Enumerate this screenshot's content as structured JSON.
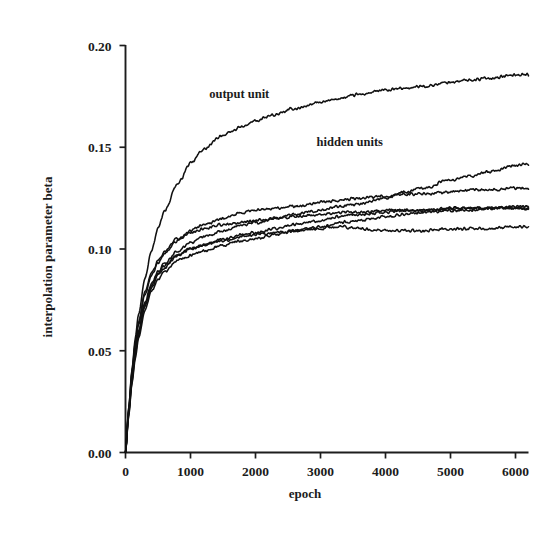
{
  "chart_data": {
    "type": "line",
    "title": "",
    "xlabel": "epoch",
    "ylabel": "interpolation parameter beta",
    "xlim": [
      0,
      6200
    ],
    "ylim": [
      0.0,
      0.2
    ],
    "grid": false,
    "legend": "none",
    "xticks": [
      0,
      1000,
      2000,
      3000,
      4000,
      5000,
      6000
    ],
    "xticklabels": [
      "0",
      "1000",
      "2000",
      "3000",
      "4000",
      "5000",
      "6000"
    ],
    "yticks": [
      0.0,
      0.05,
      0.1,
      0.15,
      0.2
    ],
    "yticklabels": [
      "0.00",
      "0.05",
      "0.10",
      "0.15",
      "0.20"
    ],
    "annotations": [
      {
        "text": "output unit",
        "x": 1750,
        "y": 0.174
      },
      {
        "text": "hidden units",
        "x": 3450,
        "y": 0.1505
      }
    ],
    "x": [
      0,
      50,
      100,
      150,
      200,
      300,
      400,
      500,
      600,
      800,
      1000,
      1200,
      1500,
      1800,
      2000,
      2300,
      2600,
      3000,
      3300,
      3600,
      4000,
      4300,
      4600,
      5000,
      5300,
      5600,
      6000,
      6150
    ],
    "series": [
      {
        "name": "output unit",
        "group": "output",
        "values": [
          0.0,
          0.022,
          0.041,
          0.056,
          0.068,
          0.086,
          0.099,
          0.11,
          0.119,
          0.132,
          0.142,
          0.149,
          0.156,
          0.16,
          0.163,
          0.166,
          0.169,
          0.172,
          0.174,
          0.176,
          0.178,
          0.179,
          0.18,
          0.182,
          0.183,
          0.184,
          0.1855,
          0.186
        ]
      },
      {
        "name": "hidden unit 1",
        "group": "hidden",
        "values": [
          0.0,
          0.02,
          0.037,
          0.05,
          0.06,
          0.074,
          0.083,
          0.089,
          0.093,
          0.099,
          0.103,
          0.106,
          0.109,
          0.112,
          0.113,
          0.115,
          0.117,
          0.119,
          0.121,
          0.122,
          0.125,
          0.128,
          0.13,
          0.134,
          0.136,
          0.138,
          0.141,
          0.142
        ]
      },
      {
        "name": "hidden unit 2",
        "group": "hidden",
        "values": [
          0.0,
          0.021,
          0.039,
          0.053,
          0.063,
          0.078,
          0.087,
          0.093,
          0.098,
          0.104,
          0.109,
          0.112,
          0.115,
          0.118,
          0.119,
          0.12,
          0.121,
          0.123,
          0.124,
          0.125,
          0.126,
          0.127,
          0.127,
          0.128,
          0.129,
          0.129,
          0.13,
          0.13
        ]
      },
      {
        "name": "hidden unit 3",
        "group": "hidden",
        "values": [
          0.0,
          0.019,
          0.035,
          0.048,
          0.058,
          0.072,
          0.081,
          0.087,
          0.091,
          0.097,
          0.1,
          0.102,
          0.105,
          0.107,
          0.108,
          0.11,
          0.112,
          0.114,
          0.116,
          0.117,
          0.118,
          0.119,
          0.119,
          0.12,
          0.12,
          0.12,
          0.121,
          0.121
        ]
      },
      {
        "name": "hidden unit 4",
        "group": "hidden",
        "values": [
          0.0,
          0.022,
          0.04,
          0.054,
          0.064,
          0.079,
          0.088,
          0.094,
          0.099,
          0.105,
          0.108,
          0.11,
          0.112,
          0.113,
          0.114,
          0.115,
          0.116,
          0.117,
          0.118,
          0.118,
          0.119,
          0.119,
          0.119,
          0.12,
          0.12,
          0.12,
          0.12,
          0.12
        ]
      },
      {
        "name": "hidden unit 5",
        "group": "hidden",
        "values": [
          0.0,
          0.018,
          0.034,
          0.046,
          0.056,
          0.07,
          0.079,
          0.085,
          0.089,
          0.094,
          0.097,
          0.099,
          0.102,
          0.104,
          0.105,
          0.107,
          0.109,
          0.111,
          0.113,
          0.114,
          0.116,
          0.117,
          0.118,
          0.119,
          0.119,
          0.12,
          0.12,
          0.12
        ]
      },
      {
        "name": "hidden unit 6",
        "group": "hidden",
        "values": [
          0.0,
          0.02,
          0.036,
          0.049,
          0.059,
          0.073,
          0.082,
          0.088,
          0.092,
          0.097,
          0.1,
          0.102,
          0.104,
          0.106,
          0.107,
          0.108,
          0.109,
          0.11,
          0.111,
          0.11,
          0.109,
          0.109,
          0.109,
          0.11,
          0.11,
          0.11,
          0.111,
          0.111
        ]
      }
    ]
  },
  "colors": {
    "line": "#111111",
    "axis": "#1d1d1d",
    "text": "#1c1c1c",
    "background": "#ffffff"
  }
}
